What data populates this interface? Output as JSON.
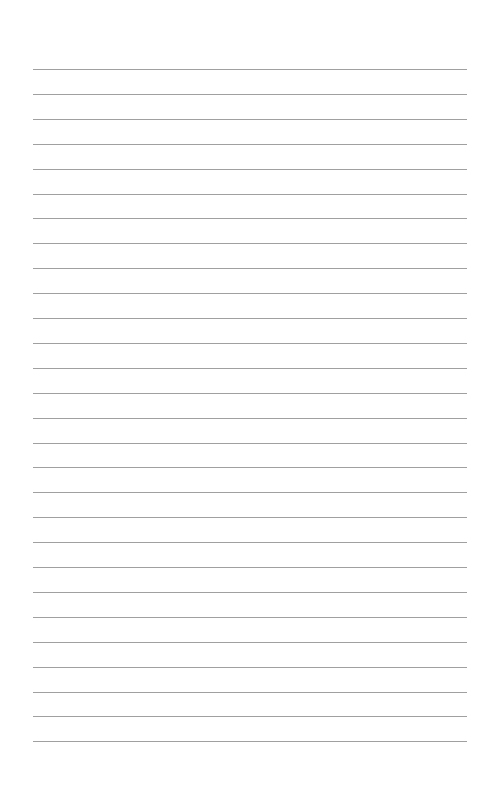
{
  "page": {
    "type": "lined-paper",
    "line_count": 28,
    "first_line_y": 69,
    "line_spacing": 24.9,
    "line_left": 33,
    "line_width": 434,
    "line_color": "#a0a0a0",
    "background_color": "#ffffff"
  }
}
